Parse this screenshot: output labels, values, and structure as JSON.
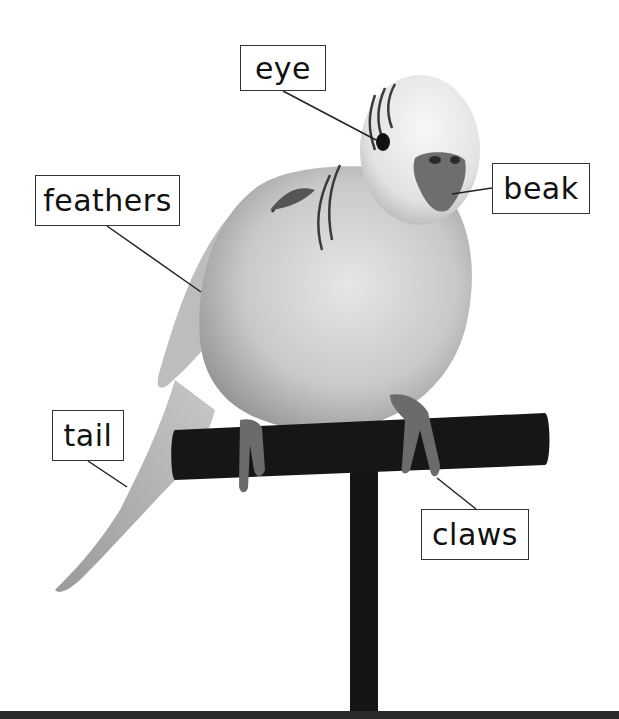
{
  "diagram": {
    "labels": [
      {
        "id": "eye",
        "text": "eye"
      },
      {
        "id": "feathers",
        "text": "feathers"
      },
      {
        "id": "beak",
        "text": "beak"
      },
      {
        "id": "tail",
        "text": "tail"
      },
      {
        "id": "claws",
        "text": "claws"
      }
    ],
    "colors": {
      "background": "#ffffff",
      "label_border": "#333333",
      "label_text": "#111111",
      "leader_line": "#222222",
      "perch": "#151515"
    }
  }
}
